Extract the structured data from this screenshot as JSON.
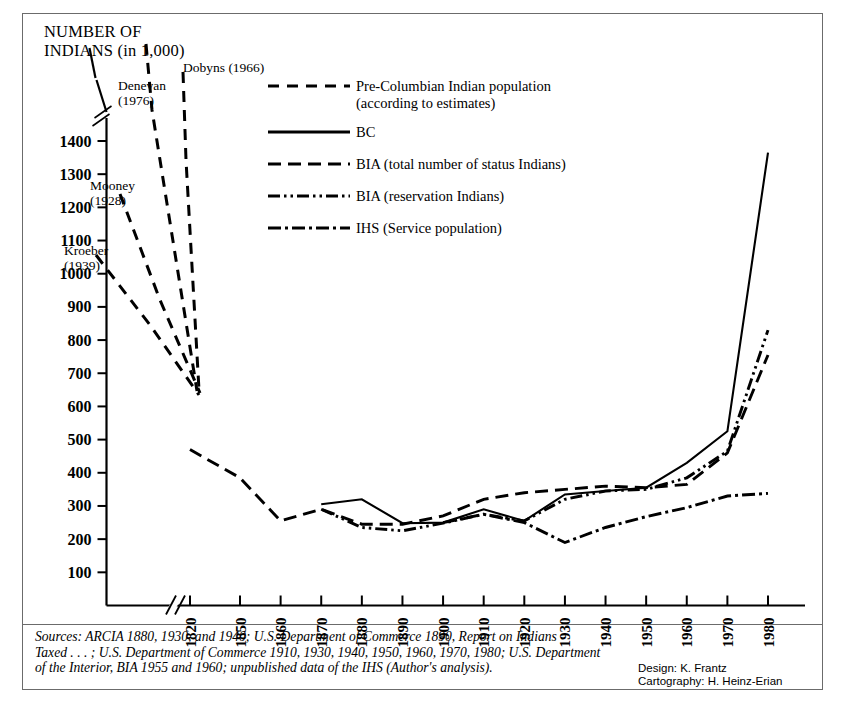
{
  "axis_title": "NUMBER OF\nINDIANS (in 1,000)",
  "legend": [
    {
      "key": "dashed-long",
      "label": "Pre-Columbian Indian population\n(according to estimates)"
    },
    {
      "key": "solid",
      "label": "BC"
    },
    {
      "key": "dashed-medium",
      "label": "BIA (total number of status Indians)"
    },
    {
      "key": "dash-dot-dot",
      "label": "BIA (reservation Indians)"
    },
    {
      "key": "dash-dot",
      "label": "IHS (Service population)"
    }
  ],
  "estimate_labels": [
    {
      "name": "Denevan",
      "text": "Denevan\n(1976)",
      "x": 118,
      "y": 78
    },
    {
      "name": "Dobyns",
      "text": "Dobyns (1966)",
      "x": 183,
      "y": 60
    },
    {
      "name": "Mooney",
      "text": "Mooney\n(1928)",
      "x": 90,
      "y": 178
    },
    {
      "name": "Kroeber",
      "text": "Kroeber\n(1939)",
      "x": 64,
      "y": 243
    }
  ],
  "sources": "Sources: ARCIA 1880, 1930, and 1940; U.S. Department of Commerce 1890, Report on Indians\nTaxed . . . ; U.S. Department of Commerce 1910, 1930, 1940, 1950, 1960, 1970, 1980; U.S. Department\nof the Interior, BIA 1955 and 1960; unpublished data of the IHS (Author's analysis).",
  "credit": "Design: K. Frantz\nCartography: H. Heinz-Erian",
  "chart_data": {
    "type": "line",
    "title": "Number of Indians (in 1,000)",
    "xlabel": "",
    "ylabel": "NUMBER OF INDIANS (in 1,000)",
    "ylim": [
      0,
      1450
    ],
    "yticks": [
      100,
      200,
      300,
      400,
      500,
      600,
      700,
      800,
      900,
      1000,
      1100,
      1200,
      1300,
      1400
    ],
    "y_axis_break_above": 1400,
    "xticks": [
      1820,
      1850,
      1860,
      1870,
      1880,
      1890,
      1900,
      1910,
      1920,
      1930,
      1940,
      1950,
      1960,
      1970,
      1980
    ],
    "x_axis_break_between": [
      1820,
      1850
    ],
    "grid": false,
    "legend_position": "upper-center",
    "series": [
      {
        "name": "Pre-Columbian Indian population (according to estimates) — Dobyns (1966)",
        "style": "dashed-long",
        "x": [
          1492,
          1820
        ],
        "values": [
          9800,
          600
        ],
        "note": "off-scale upper estimate, drawn as steep converging line"
      },
      {
        "name": "Pre-Columbian Indian population (according to estimates) — Denevan (1976)",
        "style": "dashed-long",
        "x": [
          1492,
          1820
        ],
        "values": [
          3800,
          595
        ],
        "note": "off-scale upper estimate, drawn as steep converging line"
      },
      {
        "name": "Pre-Columbian Indian population (according to estimates) — Mooney (1928)",
        "style": "dashed-long",
        "x": [
          1492,
          1820
        ],
        "values": [
          1150,
          590
        ],
        "note": "converging line from upper-left"
      },
      {
        "name": "Pre-Columbian Indian population (according to estimates) — Kroeber (1939)",
        "style": "dashed-long",
        "x": [
          1492,
          1820
        ],
        "values": [
          900,
          588
        ],
        "note": "converging line from upper-left"
      },
      {
        "name": "BC",
        "style": "solid",
        "x": [
          1870,
          1880,
          1890,
          1900,
          1910,
          1920,
          1930,
          1940,
          1950,
          1960,
          1970,
          1980
        ],
        "values": [
          305,
          320,
          248,
          250,
          290,
          255,
          335,
          345,
          355,
          430,
          525,
          1365
        ]
      },
      {
        "name": "BIA (total number of status Indians)",
        "style": "dashed-medium",
        "x": [
          1820,
          1850,
          1860,
          1870,
          1880,
          1890,
          1900,
          1910,
          1920,
          1930,
          1940,
          1950,
          1960,
          1970,
          1980
        ],
        "values": [
          470,
          385,
          255,
          290,
          245,
          245,
          270,
          320,
          340,
          350,
          360,
          355,
          365,
          460,
          755
        ]
      },
      {
        "name": "BIA (reservation Indians)",
        "style": "dash-dot-dot",
        "x": [
          1870,
          1880,
          1890,
          1900,
          1910,
          1920,
          1930,
          1940,
          1950,
          1960,
          1970,
          1980
        ],
        "values": [
          290,
          235,
          225,
          248,
          275,
          255,
          320,
          345,
          350,
          385,
          465,
          830
        ]
      },
      {
        "name": "IHS (Service population)",
        "style": "dash-dot",
        "x": [
          1900,
          1910,
          1920,
          1930,
          1940,
          1950,
          1960,
          1970,
          1980
        ],
        "values": [
          250,
          275,
          250,
          190,
          235,
          268,
          295,
          330,
          338
        ]
      }
    ]
  }
}
